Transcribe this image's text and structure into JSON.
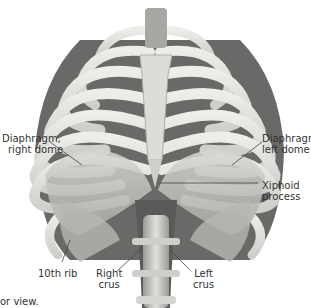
{
  "figure": {
    "caption_fragment": "or view.",
    "colors": {
      "bone": "#e4e3df",
      "bone_shadow": "#9e9d99",
      "intercostal": "#5a5958",
      "diaphragm": "#c9c8c4",
      "label_text": "#333333",
      "leader_line": "#444444"
    }
  },
  "labels": {
    "diaphragm_right": {
      "line1": "Diaphragm,",
      "line2": "right dome"
    },
    "diaphragm_left": {
      "line1": "Diaphragm,",
      "line2": "left dome"
    },
    "xiphoid": {
      "line1": "Xiphoid",
      "line2": "process"
    },
    "tenth_rib": {
      "line1": "10th rib"
    },
    "right_crus": {
      "line1": "Right",
      "line2": "crus"
    },
    "left_crus": {
      "line1": "Left",
      "line2": "crus"
    }
  }
}
